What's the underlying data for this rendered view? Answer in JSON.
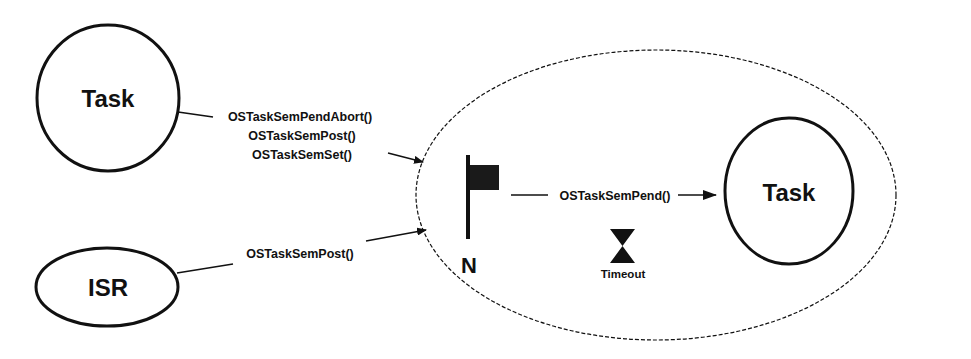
{
  "diagram": {
    "type": "semaphore-flow",
    "colors": {
      "stroke": "#111111",
      "background": "#ffffff",
      "flag_fill": "#1a1a1a"
    },
    "nodes": {
      "left_task": {
        "label": "Task",
        "shape": "circle"
      },
      "isr": {
        "label": "ISR",
        "shape": "ellipse"
      },
      "right_task": {
        "label": "Task",
        "shape": "circle"
      },
      "semaphore_group": {
        "shape": "dashed-ellipse"
      },
      "flag": {
        "icon": "flag-icon",
        "label": "N"
      },
      "timeout": {
        "icon": "hourglass-icon",
        "label": "Timeout"
      }
    },
    "edges": {
      "task_to_sem": {
        "labels": [
          "OSTaskSemPendAbort()",
          "OSTaskSemPost()",
          "OSTaskSemSet()"
        ]
      },
      "isr_to_sem": {
        "labels": [
          "OSTaskSemPost()"
        ]
      },
      "sem_to_task": {
        "labels": [
          "OSTaskSemPend()"
        ]
      }
    }
  }
}
